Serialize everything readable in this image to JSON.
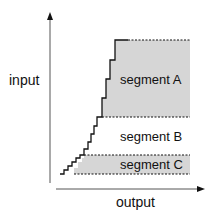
{
  "diagram": {
    "axes": {
      "y_label": "input",
      "x_label": "output"
    },
    "segments": [
      {
        "id": "A",
        "label": "segment A",
        "shaded": true,
        "fill": "#d6d6d6"
      },
      {
        "id": "B",
        "label": "segment B",
        "shaded": false,
        "fill": "#ffffff"
      },
      {
        "id": "C",
        "label": "segment C",
        "shaded": true,
        "fill": "#d6d6d6"
      }
    ],
    "line_color": "#111111"
  }
}
